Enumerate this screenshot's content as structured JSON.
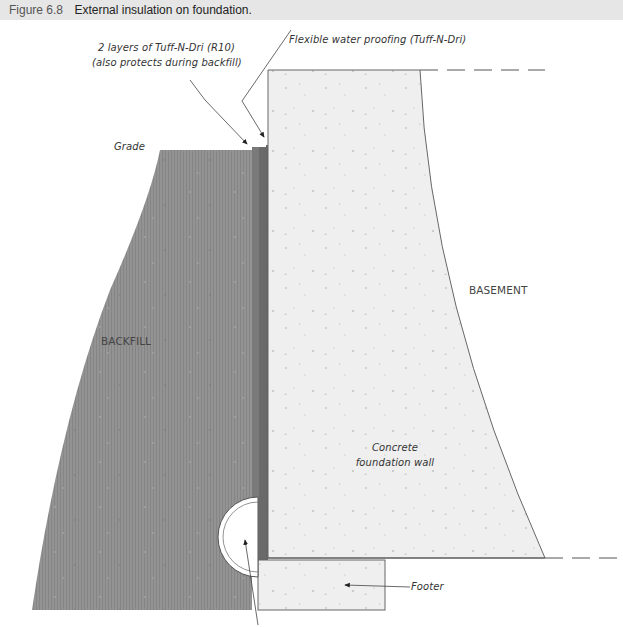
{
  "figure": {
    "number": "Figure 6.8",
    "title": "External insulation on foundation."
  },
  "labels": {
    "insulation_line1": "2 layers of Tuff-N-Dri (R10)",
    "insulation_line2": "(also protects during backfill)",
    "waterproofing": "Flexible water proofing (Tuff-N-Dri)",
    "grade": "Grade",
    "backfill": "BACKFILL",
    "basement": "BASEMENT",
    "wall_line1": "Concrete",
    "wall_line2": "foundation wall",
    "footer": "Footer"
  },
  "colors": {
    "backfill": "#8f8f8f",
    "insulation": "#6e6e6e",
    "concrete": "#efefef",
    "outline": "#555555",
    "caption_bar": "#e6e6e6"
  }
}
